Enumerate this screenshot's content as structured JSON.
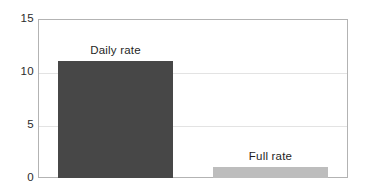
{
  "chart_data": {
    "type": "bar",
    "title": "",
    "xlabel": "",
    "ylabel": "",
    "categories": [
      "Daily rate",
      "Full rate"
    ],
    "values": [
      11,
      1
    ],
    "series": [
      {
        "name": "rate",
        "values": [
          11,
          1
        ],
        "colors": [
          "#474747",
          "#bdbdbd"
        ]
      }
    ],
    "ylim": [
      0,
      15
    ],
    "yticks": [
      0,
      5,
      10,
      15
    ],
    "ytick_labels": [
      "0",
      "5",
      "10",
      "15"
    ],
    "xticks": [],
    "xtick_labels": [],
    "grid": true,
    "grid_axis": "y",
    "legend": "none",
    "annotations": [
      {
        "text": "Daily rate",
        "category": "Daily rate",
        "position": "above-bar"
      },
      {
        "text": "Full rate",
        "category": "Full rate",
        "position": "above-bar"
      }
    ],
    "colors": {
      "bar_daily": "#474747",
      "bar_full": "#bdbdbd",
      "frame": "#b3b3b3",
      "gridline": "#e3e3e3",
      "background": "#ffffff",
      "text": "#1f1f1f"
    }
  }
}
